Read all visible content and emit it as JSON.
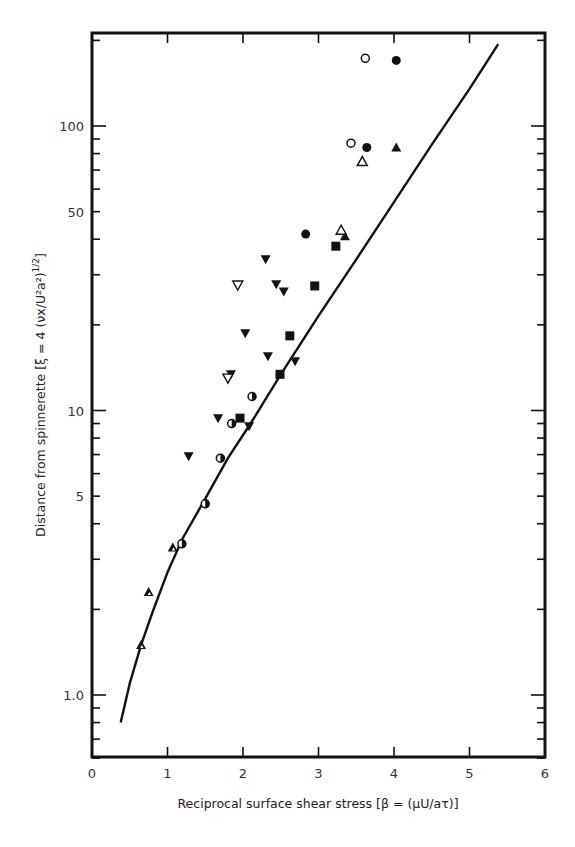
{
  "chart_data": {
    "type": "scatter",
    "title": "",
    "xlabel": "Reciprocal surface shear stress [β = (μU/aτ)]",
    "ylabel": "Distance from spinnerette [ξ = 4 (νx/U²a²)^1/2]",
    "xlim": [
      0,
      6
    ],
    "ylim": [
      0.6,
      212
    ],
    "yscale": "log",
    "grid": false,
    "legend": null,
    "x_ticks": [
      "0",
      "1",
      "2",
      "3",
      "4",
      "5",
      "6"
    ],
    "y_ticks": [
      "1.0",
      "5",
      "10",
      "50",
      "100"
    ],
    "series": [
      {
        "name": "open circle",
        "marker": "circle-open",
        "points": [
          [
            3.62,
            173
          ],
          [
            3.43,
            87
          ]
        ]
      },
      {
        "name": "filled circle",
        "marker": "circle-filled",
        "points": [
          [
            4.03,
            170
          ],
          [
            3.64,
            84
          ],
          [
            2.83,
            41.7
          ]
        ]
      },
      {
        "name": "filled triangle",
        "marker": "triangle-filled",
        "points": [
          [
            4.03,
            84
          ],
          [
            3.35,
            41
          ]
        ]
      },
      {
        "name": "open triangle",
        "marker": "triangle-open",
        "points": [
          [
            3.58,
            75
          ],
          [
            3.3,
            43
          ]
        ]
      },
      {
        "name": "filled square",
        "marker": "square-filled",
        "points": [
          [
            3.23,
            37.8
          ],
          [
            2.95,
            27.4
          ],
          [
            2.62,
            18.3
          ],
          [
            2.49,
            13.4
          ],
          [
            1.96,
            9.4
          ]
        ]
      },
      {
        "name": "filled inverted triangle",
        "marker": "inverted-triangle-filled",
        "points": [
          [
            2.3,
            34
          ],
          [
            2.44,
            27.8
          ],
          [
            2.54,
            26.2
          ],
          [
            2.03,
            18.7
          ],
          [
            2.33,
            15.5
          ],
          [
            2.69,
            14.9
          ],
          [
            1.84,
            13.4
          ],
          [
            1.67,
            9.4
          ],
          [
            2.08,
            8.8
          ],
          [
            1.28,
            6.9
          ]
        ]
      },
      {
        "name": "open inverted triangle",
        "marker": "inverted-triangle-open",
        "points": [
          [
            1.93,
            27.6
          ],
          [
            1.8,
            13.0
          ]
        ]
      },
      {
        "name": "half-filled circle",
        "marker": "circle-half",
        "points": [
          [
            2.12,
            11.2
          ],
          [
            1.85,
            9.0
          ],
          [
            1.7,
            6.8
          ],
          [
            1.5,
            4.7
          ],
          [
            1.19,
            3.4
          ]
        ]
      },
      {
        "name": "half-filled triangle",
        "marker": "triangle-half",
        "points": [
          [
            1.07,
            3.3
          ],
          [
            0.75,
            2.3
          ],
          [
            0.65,
            1.5
          ]
        ]
      }
    ],
    "curve": {
      "name": "theory",
      "points": [
        [
          0.38,
          0.8
        ],
        [
          0.5,
          1.1
        ],
        [
          0.65,
          1.5
        ],
        [
          0.8,
          1.95
        ],
        [
          1.0,
          2.7
        ],
        [
          1.2,
          3.55
        ],
        [
          1.5,
          4.9
        ],
        [
          1.8,
          6.8
        ],
        [
          2.1,
          9.0
        ],
        [
          2.5,
          13.4
        ],
        [
          3.0,
          21.5
        ],
        [
          3.5,
          34
        ],
        [
          4.0,
          54
        ],
        [
          4.5,
          86
        ],
        [
          5.0,
          135
        ],
        [
          5.38,
          194
        ]
      ]
    }
  },
  "axes": {
    "x_title": "Reciprocal surface shear stress [β = (μU/aτ)]",
    "y_title": "Distance from spinnerette [ξ = 4 (νx/U²a²)",
    "y_title_exp": "1/2",
    "y_title_close": "]"
  }
}
